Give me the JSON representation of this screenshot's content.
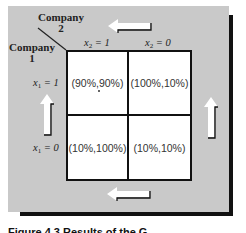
{
  "figure": {
    "row_player": {
      "label_line1": "Company",
      "label_line2": "1"
    },
    "col_player": {
      "label_line1": "Company",
      "label_line2": "2"
    },
    "columns": [
      {
        "var": "x",
        "sub": "2",
        "eq": " = 1"
      },
      {
        "var": "x",
        "sub": "2",
        "eq": " = 0"
      }
    ],
    "rows": [
      {
        "var": "x",
        "sub": "1",
        "eq": " = 1"
      },
      {
        "var": "x",
        "sub": "1",
        "eq": " = 0"
      }
    ],
    "cells": [
      [
        "(90%,90%)",
        "(100%,10%)"
      ],
      [
        "(10%,100%)",
        "(10%,10%)"
      ]
    ],
    "equilibrium_marker": "dot in (90%,90%) cell",
    "arrows": [
      {
        "position": "top",
        "direction": "left"
      },
      {
        "position": "bottom",
        "direction": "left"
      },
      {
        "position": "left",
        "direction": "up"
      },
      {
        "position": "right",
        "direction": "up"
      }
    ],
    "colors": {
      "panel": "#c9c9c9",
      "cell": "#ffffff",
      "border": "#111111",
      "arrow": "#ffffff"
    },
    "caption": "Figure 4.3   Results of the G"
  }
}
